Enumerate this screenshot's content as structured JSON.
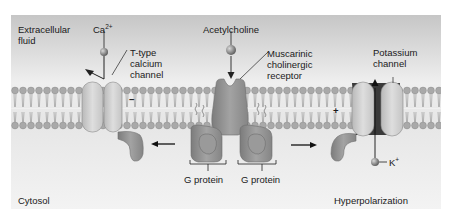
{
  "figure": {
    "regions": {
      "extracellular": [
        "Extracellular",
        "fluid"
      ],
      "cytosol": "Cytosol"
    },
    "ligands": {
      "calcium_ion": {
        "symbol": "Ca",
        "charge": "2+"
      },
      "acetylcholine": "Acetylcholine",
      "potassium_ion": {
        "symbol": "K",
        "charge": "+"
      }
    },
    "proteins": {
      "t_type_channel": [
        "T-type",
        "calcium",
        "channel"
      ],
      "muscarinic_receptor": [
        "Muscarinic",
        "cholinergic",
        "receptor"
      ],
      "potassium_channel": [
        "Potassium",
        "channel"
      ],
      "g_protein_left": "G protein",
      "g_protein_right": "G protein"
    },
    "charges": {
      "left": "−",
      "right": "+"
    },
    "outcome": "Hyperpolarization",
    "colors": {
      "background_top": "#c9c9c9",
      "background_bottom": "#f2f2f2",
      "membrane_head": "#a8a8a8",
      "protein_light": "#cfcfcf",
      "protein_dark": "#8e8e8e",
      "channel_pore": "#2b2b2b",
      "text": "#1a1a1a"
    }
  }
}
